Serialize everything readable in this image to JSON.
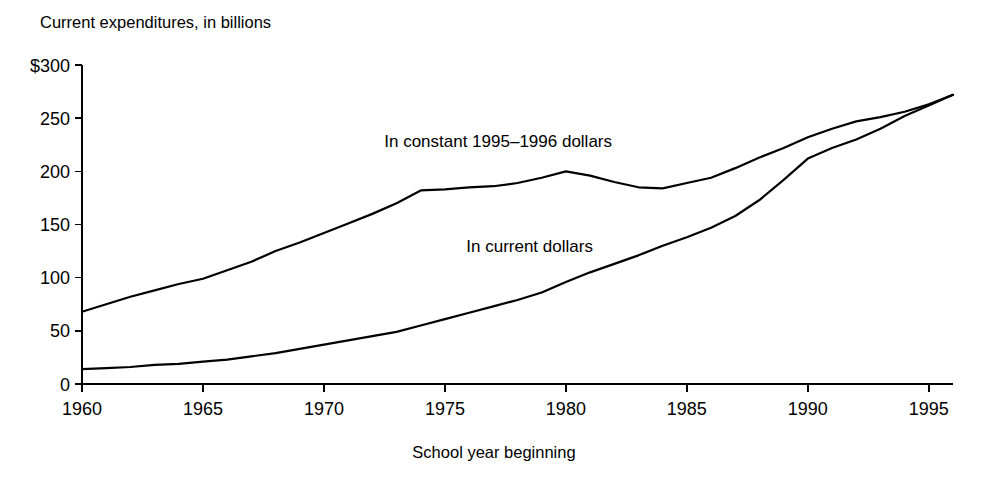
{
  "chart_data": {
    "type": "line",
    "title": "Current expenditures, in billions",
    "xlabel": "School year beginning",
    "ylabel": "",
    "xlim": [
      1960,
      1996
    ],
    "ylim": [
      0,
      300
    ],
    "grid": false,
    "legend_position": "inline-annotation",
    "y_ticks": [
      0,
      50,
      100,
      150,
      200,
      250,
      300
    ],
    "y_tick_labels": [
      "0",
      "50",
      "100",
      "150",
      "200",
      "250",
      "$300"
    ],
    "x_ticks": [
      1960,
      1965,
      1970,
      1975,
      1980,
      1985,
      1990,
      1995
    ],
    "x_tick_labels": [
      "1960",
      "1965",
      "1970",
      "1975",
      "1980",
      "1985",
      "1990",
      "1995"
    ],
    "x": [
      1960,
      1961,
      1962,
      1963,
      1964,
      1965,
      1966,
      1967,
      1968,
      1969,
      1970,
      1971,
      1972,
      1973,
      1974,
      1975,
      1976,
      1977,
      1978,
      1979,
      1980,
      1981,
      1982,
      1983,
      1984,
      1985,
      1986,
      1987,
      1988,
      1989,
      1990,
      1991,
      1992,
      1993,
      1994,
      1995,
      1996
    ],
    "series": [
      {
        "name": "In constant 1995-1996 dollars",
        "label": "In constant 1995–1996 dollars",
        "values": [
          68,
          75,
          82,
          88,
          94,
          99,
          107,
          115,
          125,
          133,
          142,
          151,
          160,
          170,
          182,
          183,
          185,
          186,
          189,
          194,
          200,
          196,
          190,
          185,
          184,
          189,
          194,
          203,
          213,
          222,
          232,
          240,
          247,
          251,
          256,
          263,
          272
        ]
      },
      {
        "name": "In current dollars",
        "label": "In current dollars",
        "values": [
          14,
          15,
          16,
          18,
          19,
          21,
          23,
          26,
          29,
          33,
          37,
          41,
          45,
          49,
          55,
          61,
          67,
          73,
          79,
          86,
          96,
          105,
          113,
          121,
          130,
          138,
          147,
          158,
          173,
          192,
          212,
          222,
          230,
          240,
          252,
          262,
          272
        ]
      }
    ],
    "annotations": [
      {
        "text": "In constant 1995–1996 dollars",
        "x": 1977.2,
        "y": 223
      },
      {
        "text": "In current dollars",
        "x": 1978.5,
        "y": 124
      }
    ]
  },
  "axes_geometry": {
    "plot_left": 82,
    "plot_right": 953,
    "plot_top": 65,
    "plot_bottom": 384
  }
}
